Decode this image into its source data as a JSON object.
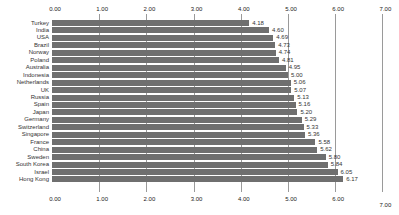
{
  "chart_data": {
    "type": "bar",
    "orientation": "horizontal",
    "title": "",
    "xlabel": "",
    "ylabel": "",
    "xlim": [
      0,
      7
    ],
    "x_ticks": [
      "0.00",
      "1.00",
      "2.00",
      "3.00",
      "4.00",
      "5.00",
      "6.00",
      "7.00"
    ],
    "grid": true,
    "legend": null,
    "bar_color": "#6f6f6f",
    "categories": [
      "Turkey",
      "India",
      "USA",
      "Brazil",
      "Norway",
      "Poland",
      "Australia",
      "Indonesia",
      "Netherlands",
      "UK",
      "Russia",
      "Spain",
      "Japan",
      "Germany",
      "Switzerland",
      "Singapore",
      "France",
      "China",
      "Sweden",
      "South Korea",
      "Israel",
      "Hong Kong"
    ],
    "values": [
      4.18,
      4.6,
      4.69,
      4.73,
      4.74,
      4.81,
      4.95,
      5.0,
      5.06,
      5.07,
      5.13,
      5.16,
      5.2,
      5.29,
      5.33,
      5.36,
      5.58,
      5.62,
      5.8,
      5.84,
      6.05,
      6.17
    ],
    "value_labels": [
      "4.18",
      "4.60",
      "4.69",
      "4.73",
      "4.74",
      "4.81",
      "4.95",
      "5.00",
      "5.06",
      "5.07",
      "5.13",
      "5.16",
      "5.20",
      "5.29",
      "5.33",
      "5.36",
      "5.58",
      "5.62",
      "5.80",
      "5.84",
      "6.05",
      "6.17"
    ]
  }
}
